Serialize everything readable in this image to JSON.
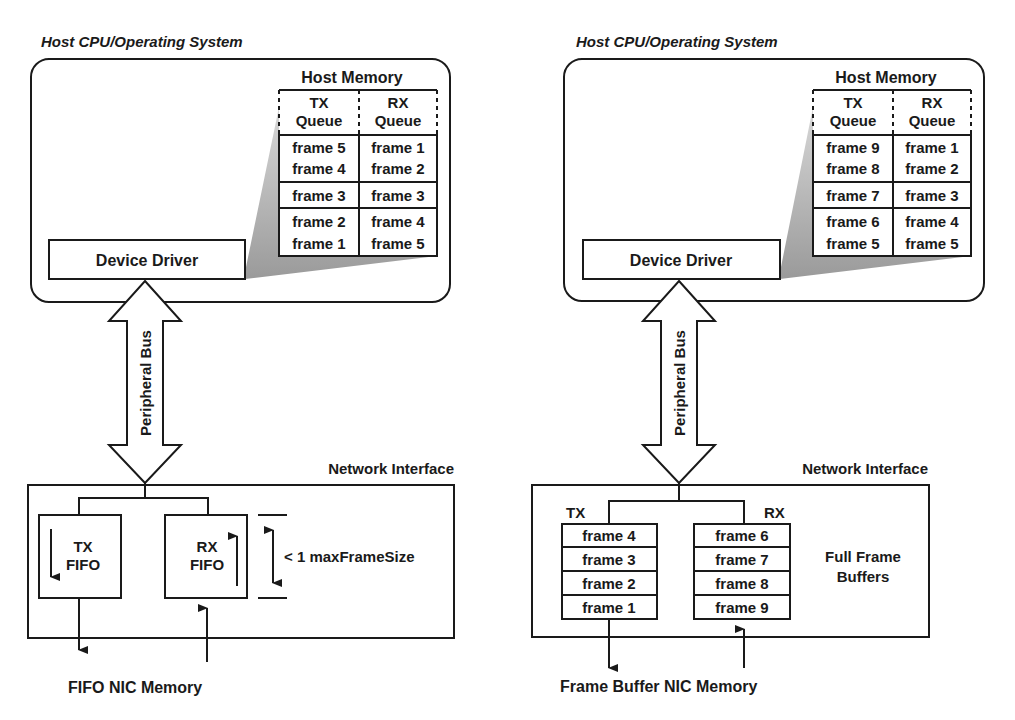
{
  "left": {
    "host_title": "Host CPU/Operating System",
    "host_memory_label": "Host Memory",
    "queue_headers": {
      "tx_line1": "TX",
      "tx_line2": "Queue",
      "rx_line1": "RX",
      "rx_line2": "Queue"
    },
    "tx_queue": [
      "frame 5",
      "frame 4",
      "frame 3",
      "frame 2",
      "frame 1"
    ],
    "rx_queue": [
      "frame 1",
      "frame 2",
      "frame 3",
      "frame 4",
      "frame 5"
    ],
    "device_driver": "Device Driver",
    "bus_label": "Peripheral Bus",
    "network_interface": "Network Interface",
    "tx_fifo": {
      "line1": "TX",
      "line2": "FIFO"
    },
    "rx_fifo": {
      "line1": "RX",
      "line2": "FIFO"
    },
    "dimension_label": "< 1 maxFrameSize",
    "caption": "FIFO NIC Memory"
  },
  "right": {
    "host_title": "Host CPU/Operating System",
    "host_memory_label": "Host Memory",
    "queue_headers": {
      "tx_line1": "TX",
      "tx_line2": "Queue",
      "rx_line1": "RX",
      "rx_line2": "Queue"
    },
    "tx_queue": [
      "frame 9",
      "frame 8",
      "frame 7",
      "frame 6",
      "frame 5"
    ],
    "rx_queue": [
      "frame 1",
      "frame 2",
      "frame 3",
      "frame 4",
      "frame 5"
    ],
    "device_driver": "Device Driver",
    "bus_label": "Peripheral Bus",
    "network_interface": "Network Interface",
    "tx_label": "TX",
    "rx_label": "RX",
    "tx_buffers": [
      "frame 4",
      "frame 3",
      "frame 2",
      "frame 1"
    ],
    "rx_buffers": [
      "frame 6",
      "frame 7",
      "frame 8",
      "frame 9"
    ],
    "buffers_label": {
      "line1": "Full Frame",
      "line2": "Buffers"
    },
    "caption": "Frame Buffer NIC Memory"
  }
}
